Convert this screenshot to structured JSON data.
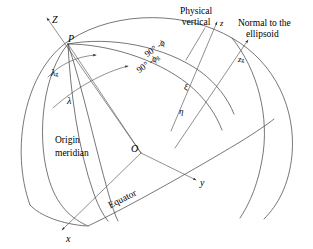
{
  "figure": {
    "width": 313,
    "height": 249,
    "background_color": "#ffffff",
    "line_color": "#3c3c3c"
  },
  "axes": [
    {
      "id": "Z",
      "label": "Z",
      "description": "Earth rotation axis, up-left from origin"
    },
    {
      "id": "x",
      "label": "x",
      "description": "x axis toward viewer, down-left"
    },
    {
      "id": "y",
      "label": "y",
      "description": "y axis to the right"
    },
    {
      "id": "z",
      "label": "z",
      "description": "local physical vertical at P"
    },
    {
      "id": "zg",
      "label": "z",
      "subscript": "g",
      "description": "normal to the ellipsoid at P"
    }
  ],
  "points": [
    {
      "id": "P",
      "label": "P",
      "description": "surface point on the ellipsoid"
    },
    {
      "id": "O",
      "label": "O",
      "description": "origin / centre of the ellipsoid"
    }
  ],
  "angles": [
    {
      "id": "lambda_g",
      "label": "λ",
      "subscript": "g",
      "description": "geodetic longitude"
    },
    {
      "id": "lambda",
      "label": "λ",
      "subscript": "",
      "description": "astronomic longitude"
    },
    {
      "id": "colatitude_phi",
      "label": "90° - ϕ",
      "subscript": "",
      "description": "astronomic co-latitude"
    },
    {
      "id": "colatitude_phi_g",
      "label": "90° - ϕ",
      "subscript": "g",
      "description": "geodetic co-latitude"
    },
    {
      "id": "xi",
      "label": "ξ",
      "description": "deflection of the vertical, meridian component"
    },
    {
      "id": "eta",
      "label": "η",
      "description": "deflection of the vertical, prime vertical component"
    }
  ],
  "callouts": [
    {
      "id": "physical-vertical",
      "line1": "Physical",
      "line2": "vertical"
    },
    {
      "id": "normal-to-ellipsoid",
      "line1": "Normal to the",
      "line2": "ellipsoid"
    },
    {
      "id": "origin-meridian",
      "line1": "Origin",
      "line2": "meridian"
    },
    {
      "id": "equator",
      "line1": "Equator"
    }
  ],
  "labels": {
    "Z_axis": "Z",
    "x_axis": "x",
    "y_axis": "y",
    "z_axis": "z",
    "zg_axis": "z",
    "zg_sub": "g",
    "point_P": "P",
    "point_O": "O",
    "lambda_g": "λ",
    "lambda_g_sub": "g",
    "lambda": "λ",
    "colat_deg": "90° -",
    "colat_phi": "ϕ",
    "colat_g_deg": "90° -",
    "colat_g_phi": "ϕ",
    "colat_g_sub": "g",
    "xi": "ξ",
    "eta": "η",
    "physical_vertical_1": "Physical",
    "physical_vertical_2": "vertical",
    "normal_ellipsoid_1": "Normal to the",
    "normal_ellipsoid_2": "ellipsoid",
    "origin_meridian_1": "Origin",
    "origin_meridian_2": "meridian",
    "equator": "Equator"
  }
}
